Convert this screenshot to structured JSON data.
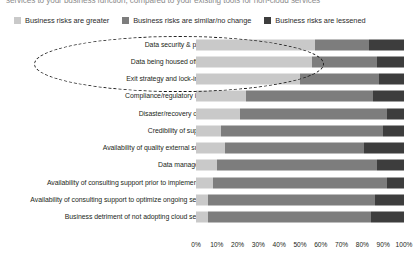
{
  "intro": {
    "text": "services to your business function, compared to your existing tools for non-cloud services"
  },
  "legend": {
    "position": "top-left",
    "items": [
      {
        "label": "Business risks are greater",
        "color": "#c9c9c9",
        "icon": "legend-swatch-greater"
      },
      {
        "label": "Business risks are similar/no change",
        "color": "#7d7d7d",
        "icon": "legend-swatch-similar"
      },
      {
        "label": "Business risks are lessened",
        "color": "#3d3d3d",
        "icon": "legend-swatch-lessened"
      }
    ]
  },
  "annotation": {
    "shape": "dashed-ellipse",
    "encircles": [
      "Data security & privacy",
      "Data being housed offshore",
      "Exit strategy and lock-in risks"
    ]
  },
  "chart_data": {
    "type": "bar",
    "orientation": "horizontal",
    "stacked": true,
    "stack_mode": "percent",
    "title": "",
    "subtitle": "",
    "xlabel": "",
    "ylabel": "",
    "xlim": [
      0,
      100
    ],
    "xticks": [
      "0%",
      "10%",
      "20%",
      "30%",
      "40%",
      "50%",
      "60%",
      "70%",
      "80%",
      "90%",
      "100%"
    ],
    "grid": true,
    "legend_position": "top-left",
    "categories": [
      "Data security & privacy",
      "Data being housed offshore",
      "Exit strategy and lock-in risks",
      "Compliance/regulatory issues",
      "Disaster/recovery of data",
      "Credibility of suppliers",
      "Availability of quality external support",
      "Data management",
      "Availability of consulting support prior to implementation",
      "Availability of consulting support to optimize ongoing services",
      "Business detriment of not adopting cloud services"
    ],
    "series": [
      {
        "name": "Business risks are greater",
        "color": "#c9c9c9",
        "values": [
          57,
          56,
          50,
          24,
          21,
          12,
          14,
          10,
          8,
          6,
          6
        ]
      },
      {
        "name": "Business risks are similar/no change",
        "color": "#7d7d7d",
        "values": [
          26,
          31,
          38,
          61,
          71,
          78,
          67,
          77,
          84,
          80,
          78
        ]
      },
      {
        "name": "Business risks are lessened",
        "color": "#3d3d3d",
        "values": [
          17,
          13,
          12,
          15,
          8,
          10,
          19,
          13,
          8,
          14,
          16
        ]
      }
    ]
  }
}
